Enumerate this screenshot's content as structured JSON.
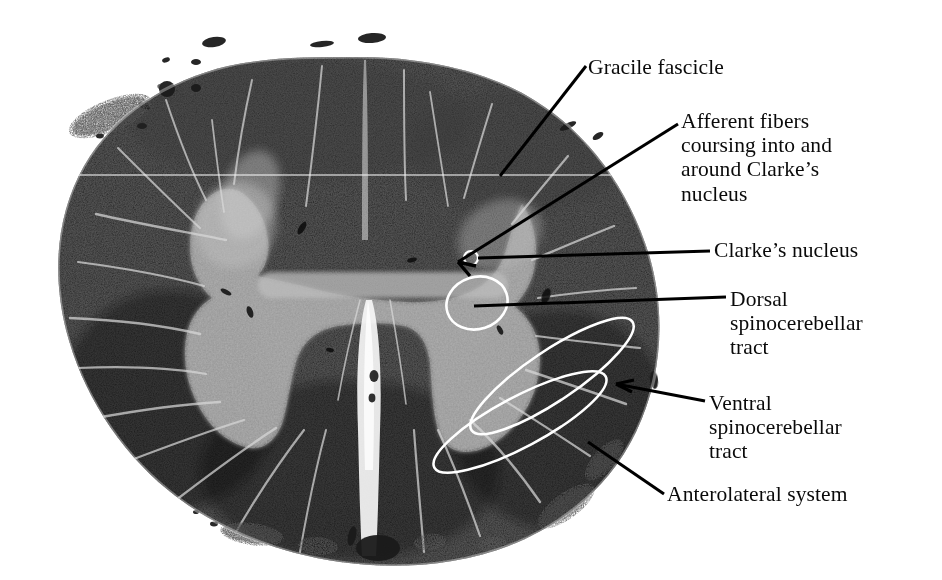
{
  "figure": {
    "kind": "histology-micrograph",
    "background_color": "#ffffff",
    "tissue_dark_color": "#1d1d1d",
    "tissue_mid_color": "#4a4a4a",
    "gray_matter_color": "#a9a9a9",
    "annotation_outline_color": "#ffffff",
    "leader_line_color": "#000000",
    "label_text_color": "#0a0a0a"
  },
  "labels": [
    {
      "id": "gracile-fascicle",
      "lines": [
        "Gracile fascicle"
      ],
      "x": 588,
      "y": 56,
      "leader": {
        "from": [
          586,
          66
        ],
        "to": [
          500,
          176
        ],
        "style": "plain"
      }
    },
    {
      "id": "afferent-fibers",
      "lines": [
        "Afferent fibers",
        "coursing into and",
        "around Clarke’s",
        "nucleus"
      ],
      "x": 681,
      "y": 110,
      "leader": {
        "from": [
          678,
          124
        ],
        "to": [
          455,
          262
        ],
        "style": "arrow"
      }
    },
    {
      "id": "clarkes-nucleus",
      "lines": [
        "Clarke’s nucleus"
      ],
      "x": 714,
      "y": 239,
      "leader": {
        "from": [
          710,
          251
        ],
        "to": [
          480,
          258
        ],
        "style": "plain"
      }
    },
    {
      "id": "dorsal-spinocerebellar-tract",
      "lines": [
        "Dorsal",
        "spinocerebellar",
        "tract"
      ],
      "x": 730,
      "y": 288,
      "leader": {
        "from": [
          726,
          297
        ],
        "to": [
          477,
          305
        ],
        "style": "plain"
      }
    },
    {
      "id": "ventral-spinocerebellar-tract",
      "lines": [
        "Ventral",
        "spinocerebellar",
        "tract"
      ],
      "x": 709,
      "y": 392,
      "leader": {
        "from": [
          705,
          402
        ],
        "to": [
          612,
          384
        ],
        "style": "plain"
      }
    },
    {
      "id": "anterolateral-system",
      "lines": [
        "Anterolateral system"
      ],
      "x": 667,
      "y": 483,
      "leader": {
        "from": [
          664,
          494
        ],
        "to": [
          590,
          443
        ],
        "style": "plain"
      }
    }
  ],
  "annotations": {
    "clarkes_nucleus_outline": {
      "cx": 477,
      "cy": 303,
      "rx": 31,
      "ry": 26,
      "rotate": -18
    },
    "afferent_small_circle": {
      "cx": 471,
      "cy": 258,
      "r": 7
    },
    "tract_outline_upper": {
      "cx": 548,
      "cy": 378,
      "rx": 96,
      "ry": 26,
      "rotate": -34
    },
    "tract_outline_lower": {
      "cx": 523,
      "cy": 419,
      "rx": 96,
      "ry": 26,
      "rotate": -28
    }
  }
}
